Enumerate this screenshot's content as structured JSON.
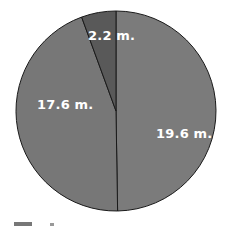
{
  "chart_data": {
    "type": "pie",
    "title": "",
    "unit": "m.",
    "slices": [
      {
        "label": "19.6 m.",
        "value": 19.6,
        "color": "#7b7b7b"
      },
      {
        "label": "17.6 m.",
        "value": 17.6,
        "color": "#777777"
      },
      {
        "label": "2.2 m.",
        "value": 2.2,
        "color": "#595959"
      }
    ],
    "start_angle_deg": 0,
    "direction": "clockwise",
    "legend": {
      "position": "bottom",
      "visible": "cut-off"
    }
  },
  "labels": {
    "slice_1": "19.6 m.",
    "slice_2": "17.6 m.",
    "slice_3": "2.2 m."
  }
}
